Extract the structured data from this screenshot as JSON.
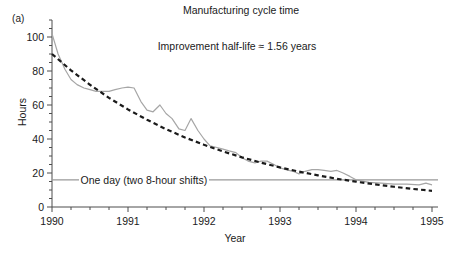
{
  "figure": {
    "panel_label": "(a)",
    "title": "Manufacturing cycle time",
    "subtitle": "Improvement half-life ≈ 1.56 years",
    "background_color": "#ffffff",
    "axis_color": "#4d4d4d",
    "data_line_color": "#a6a6a6",
    "fit_line_color": "#1a1a1a",
    "threshold_line_color": "#999999"
  },
  "chart_data": {
    "type": "line",
    "title": "Manufacturing cycle time",
    "subtitle": "Improvement half-life ≈ 1.56 years",
    "xlabel": "Year",
    "ylabel": "Hours",
    "xlim": [
      1990,
      1995
    ],
    "ylim": [
      0,
      110
    ],
    "xticks": [
      1990,
      1991,
      1992,
      1993,
      1994,
      1995
    ],
    "xticklabels": [
      "1990",
      "1991",
      "1992",
      "1993",
      "1994",
      "1995"
    ],
    "yticks": [
      0,
      20,
      40,
      60,
      80,
      100
    ],
    "yticklabels": [
      "0",
      "20",
      "40",
      "60",
      "80",
      "100"
    ],
    "x_minor_tick_step": 0.25,
    "y_minor_tick_step": 5,
    "grid": false,
    "legend": null,
    "annotations": [
      {
        "name": "one-day-threshold",
        "text": "One day (two 8-hour shifts)",
        "type": "hline",
        "y_value": 16,
        "x_start": 1990,
        "x_end": 1995,
        "label_x": 1990.35,
        "color": "#999999"
      }
    ],
    "series": [
      {
        "name": "Measured cycle time",
        "style": "solid",
        "color": "#a6a6a6",
        "x": [
          1990.0,
          1990.08,
          1990.17,
          1990.25,
          1990.33,
          1990.42,
          1990.5,
          1990.58,
          1990.67,
          1990.75,
          1990.83,
          1990.92,
          1991.0,
          1991.08,
          1991.17,
          1991.25,
          1991.33,
          1991.42,
          1991.5,
          1991.58,
          1991.67,
          1991.75,
          1991.83,
          1991.92,
          1992.0,
          1992.08,
          1992.17,
          1992.25,
          1992.33,
          1992.42,
          1992.5,
          1992.58,
          1992.67,
          1992.75,
          1992.83,
          1992.92,
          1993.0,
          1993.08,
          1993.17,
          1993.25,
          1993.33,
          1993.42,
          1993.5,
          1993.58,
          1993.67,
          1993.75,
          1993.83,
          1993.92,
          1994.0,
          1994.17,
          1994.33,
          1994.5,
          1994.67,
          1994.83,
          1994.92,
          1995.0
        ],
        "y": [
          102,
          90,
          81,
          75,
          72,
          70,
          69,
          68,
          68,
          68,
          69,
          70,
          70.5,
          70,
          62,
          57,
          56,
          60,
          55,
          52,
          46,
          45,
          52,
          45,
          40,
          36,
          35,
          34,
          33,
          32,
          29,
          27,
          26,
          27,
          27,
          25,
          23,
          22,
          21,
          19.5,
          21,
          22,
          22,
          21.5,
          21,
          21.5,
          20,
          18,
          16,
          14.5,
          14,
          13.5,
          13.5,
          13,
          14,
          13
        ]
      },
      {
        "name": "Exponential fit (half-life 1.56 years)",
        "style": "dashed",
        "color": "#1a1a1a",
        "x": [
          1990.0,
          1990.25,
          1990.5,
          1990.75,
          1991.0,
          1991.25,
          1991.5,
          1991.75,
          1992.0,
          1992.25,
          1992.5,
          1992.75,
          1993.0,
          1993.25,
          1993.5,
          1993.75,
          1994.0,
          1994.25,
          1994.5,
          1994.75,
          1995.0
        ],
        "y": [
          90.0,
          80.4,
          71.9,
          64.2,
          57.4,
          51.3,
          45.8,
          40.9,
          36.6,
          32.7,
          29.2,
          26.1,
          23.3,
          20.8,
          18.6,
          16.6,
          14.9,
          13.3,
          11.9,
          10.6,
          9.5
        ]
      }
    ]
  }
}
